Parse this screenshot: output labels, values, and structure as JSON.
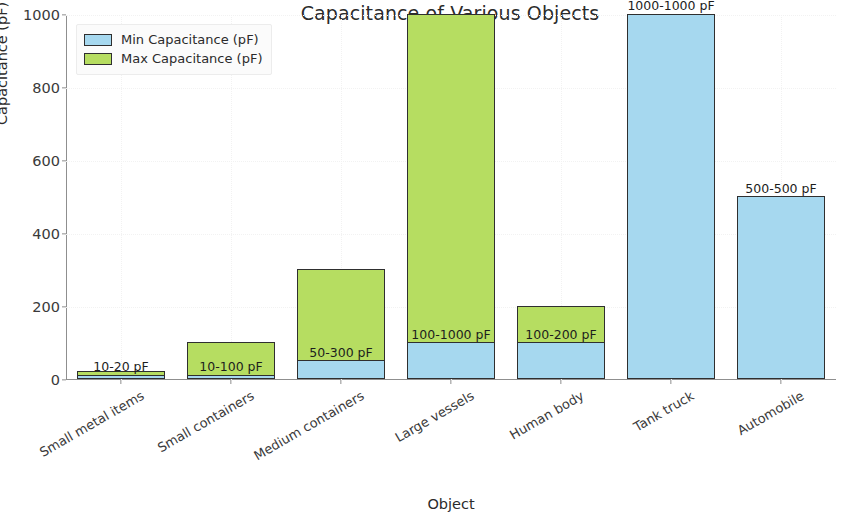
{
  "chart_data": {
    "type": "bar",
    "title": "Capacitance of Various Objects",
    "xlabel": "Object",
    "ylabel": "Capacitance (pF)",
    "ylim": [
      0,
      1000
    ],
    "yticks": [
      0,
      200,
      400,
      600,
      800,
      1000
    ],
    "grid": true,
    "legend_position": "upper left",
    "stacked_overlay": true,
    "categories": [
      "Small metal items",
      "Small containers",
      "Medium containers",
      "Large vessels",
      "Human body",
      "Tank truck",
      "Automobile"
    ],
    "series": [
      {
        "name": "Min Capacitance (pF)",
        "color": "#a6d8ef",
        "values": [
          10,
          10,
          50,
          100,
          100,
          1000,
          500
        ]
      },
      {
        "name": "Max Capacitance (pF)",
        "color": "#b6dd61",
        "values": [
          20,
          100,
          300,
          1000,
          200,
          1000,
          500
        ]
      }
    ],
    "annotations": [
      "10-20 pF",
      "10-100 pF",
      "50-300 pF",
      "100-1000 pF",
      "100-200 pF",
      "1000-1000 pF",
      "500-500 pF"
    ]
  },
  "colors": {
    "min_bar": "#a6d8ef",
    "max_bar": "#b6dd61",
    "bar_edge": "#2f2f2f",
    "axis": "#8f8f8f",
    "text": "#2b2b2b",
    "grid": "#f2f2f2",
    "background": "#ffffff"
  }
}
